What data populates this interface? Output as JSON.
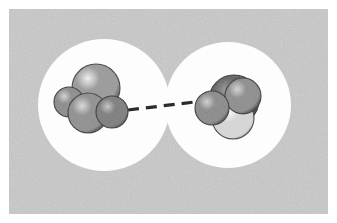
{
  "figure": {
    "kind": "space-filling molecular model illustration",
    "canvas": {
      "width": 337,
      "height": 223
    },
    "background": {
      "name": "gray-noise-panel",
      "color": "#c9c9c9",
      "noise_color": "#bdbdbd",
      "x": 9,
      "y": 9,
      "width": 319,
      "height": 205,
      "outer_margin_color": "#ffffff"
    },
    "shells": [
      {
        "id": "left-shell",
        "label": "left solvation shell",
        "color": "#fdfdfd",
        "cx": 104,
        "cy": 105,
        "r": 66
      },
      {
        "id": "right-shell",
        "label": "right solvation shell",
        "color": "#fdfdfd",
        "cx": 228,
        "cy": 105,
        "r": 63
      }
    ],
    "bond": {
      "name": "hydrogen-bond-dashed-line",
      "label": "hydrogen bond",
      "color": "#2b2b2b",
      "x1": 128,
      "y1": 110,
      "x2": 203,
      "y2": 101,
      "stroke_width": 3.2,
      "dash_pattern": "11 7",
      "dash_count": 5
    },
    "molecules": [
      {
        "id": "left-molecule",
        "label": "left space-filling molecule",
        "atoms": [
          {
            "name": "atom-large-back",
            "cx": 96,
            "cy": 88,
            "r": 24,
            "shade": "light-gray",
            "base": "#9a9a9a",
            "highlight": "#f2f2f2",
            "rim": "#3a3a3a",
            "hx": -0.34,
            "hy": -0.4
          },
          {
            "name": "atom-left-rear",
            "cx": 69,
            "cy": 102,
            "r": 15,
            "shade": "mid-gray",
            "base": "#8b8b8b",
            "highlight": "#d4d4d4",
            "rim": "#2e2e2e",
            "hx": -0.32,
            "hy": -0.38
          },
          {
            "name": "atom-front-lower",
            "cx": 88,
            "cy": 113,
            "r": 20,
            "shade": "mid-gray",
            "base": "#8f8f8f",
            "highlight": "#dcdcdc",
            "rim": "#303030",
            "hx": -0.3,
            "hy": -0.36
          },
          {
            "name": "atom-right-front",
            "cx": 112,
            "cy": 112,
            "r": 16,
            "shade": "dark-gray",
            "base": "#7c7c7c",
            "highlight": "#c6c6c6",
            "rim": "#2a2a2a",
            "hx": -0.28,
            "hy": -0.34
          }
        ]
      },
      {
        "id": "right-molecule",
        "label": "right space-filling molecule",
        "atoms": [
          {
            "name": "atom-rear-dark",
            "cx": 234,
            "cy": 100,
            "r": 25,
            "shade": "darkest-gray",
            "base": "#5e5e5e",
            "highlight": "#9c9c9c",
            "rim": "#242424",
            "hx": -0.3,
            "hy": -0.4
          },
          {
            "name": "atom-bright-front",
            "cx": 233,
            "cy": 118,
            "r": 21,
            "shade": "white-highlight",
            "base": "#d8d8d8",
            "highlight": "#ffffff",
            "rim": "#3a3a3a",
            "hx": -0.22,
            "hy": -0.3
          },
          {
            "name": "atom-upper-right",
            "cx": 243,
            "cy": 96,
            "r": 18,
            "shade": "mid-gray",
            "base": "#8d8d8d",
            "highlight": "#d6d6d6",
            "rim": "#2d2d2d",
            "hx": -0.32,
            "hy": -0.38
          },
          {
            "name": "atom-left-front",
            "cx": 212,
            "cy": 108,
            "r": 17,
            "shade": "mid-gray",
            "base": "#8a8a8a",
            "highlight": "#d2d2d2",
            "rim": "#2c2c2c",
            "hx": -0.3,
            "hy": -0.36
          }
        ]
      }
    ],
    "palette": {
      "panel_gray": "#c9c9c9",
      "shell_white": "#fdfdfd",
      "bond_dark": "#2b2b2b",
      "atom_light": "#f2f2f2",
      "atom_mid": "#8f8f8f",
      "atom_dark": "#5e5e5e"
    }
  }
}
